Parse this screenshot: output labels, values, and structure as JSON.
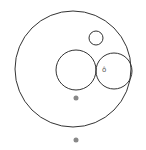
{
  "diagram": {
    "width": 146,
    "height": 150,
    "stroke_color": "#333333",
    "dot_color": "#888888",
    "circles": [
      {
        "name": "outer-circle",
        "cx": 73,
        "cy": 69,
        "r": 58
      },
      {
        "name": "small-top-circle",
        "cx": 96,
        "cy": 38,
        "r": 7
      },
      {
        "name": "middle-left-circle",
        "cx": 76,
        "cy": 70,
        "r": 20
      },
      {
        "name": "middle-right-circle",
        "cx": 114,
        "cy": 71,
        "r": 18
      }
    ],
    "dots": [
      {
        "name": "inner-dot",
        "cx": 76,
        "cy": 98,
        "r": 2.5
      },
      {
        "name": "outer-dot",
        "cx": 76,
        "cy": 140,
        "r": 2.5
      }
    ],
    "glyph": {
      "name": "small-marker-glyph",
      "x": 102,
      "y": 72,
      "text": "ô"
    }
  }
}
